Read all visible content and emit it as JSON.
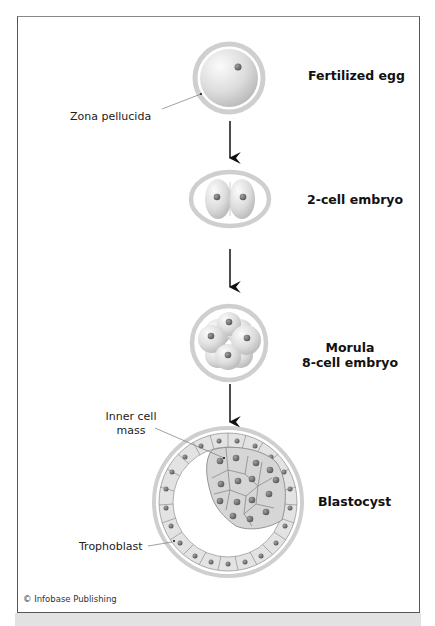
{
  "stages": [
    {
      "id": "fertilized-egg",
      "label": "Fertilized egg"
    },
    {
      "id": "2-cell",
      "label": "2-cell embryo"
    },
    {
      "id": "morula",
      "label": "Morula",
      "sublabel": "8-cell embryo"
    },
    {
      "id": "blastocyst",
      "label": "Blastocyst"
    }
  ],
  "parts": {
    "zona_pellucida": "Zona pellucida",
    "inner_cell_mass_line1": "Inner cell",
    "inner_cell_mass_line2": "mass",
    "trophoblast": "Trophoblast"
  },
  "credit": "© Infobase Publishing",
  "colors": {
    "zona": "#c8c8c8",
    "cell": "#e6e6e6",
    "nucleus": "#6e6e6e",
    "icm_cell": "#d2d2d2",
    "arrow": "#111111",
    "frame": "#555555",
    "band": "#e2e2e2"
  }
}
